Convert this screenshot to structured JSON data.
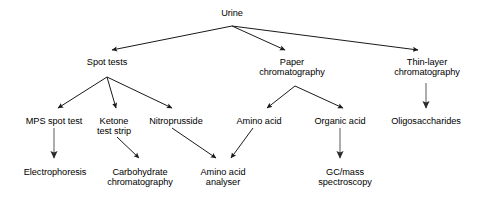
{
  "diagram": {
    "type": "flowchart",
    "background_color": "#ffffff",
    "text_color": "#000000",
    "arrow_color_dark": "#1a1a1a",
    "arrow_color_gray": "#808080",
    "nodes": [
      {
        "id": "urine",
        "label": "Urine",
        "x": 232,
        "y": 8,
        "level": 0
      },
      {
        "id": "spot-tests",
        "label": "Spot tests",
        "x": 107,
        "y": 57,
        "level": 1
      },
      {
        "id": "paper-chrom",
        "label": "Paper\nchromatography",
        "x": 292,
        "y": 57,
        "level": 1
      },
      {
        "id": "thin-layer",
        "label": "Thin-layer\nchromatography",
        "x": 427,
        "y": 57,
        "level": 1
      },
      {
        "id": "mps-spot-test",
        "label": "MPS spot test",
        "x": 54,
        "y": 116,
        "level": 2
      },
      {
        "id": "ketone-strip",
        "label": "Ketone\ntest strip",
        "x": 114,
        "y": 116,
        "level": 2
      },
      {
        "id": "nitroprusside",
        "label": "Nitroprusside",
        "x": 176,
        "y": 116,
        "level": 2
      },
      {
        "id": "amino-acid",
        "label": "Amino acid",
        "x": 259,
        "y": 116,
        "level": 2
      },
      {
        "id": "organic-acid",
        "label": "Organic acid",
        "x": 340,
        "y": 116,
        "level": 2
      },
      {
        "id": "oligosaccharides",
        "label": "Oligosaccharides",
        "x": 426,
        "y": 116,
        "level": 2
      },
      {
        "id": "electrophoresis",
        "label": "Electrophoresis",
        "x": 55,
        "y": 167,
        "level": 3
      },
      {
        "id": "carbohydrate",
        "label": "Carbohydrate\nchromatography",
        "x": 140,
        "y": 167,
        "level": 3
      },
      {
        "id": "aa-analyser",
        "label": "Amino acid\nanalyser",
        "x": 223,
        "y": 167,
        "level": 3
      },
      {
        "id": "gc-mass",
        "label": "GC/mass\nspectroscopy",
        "x": 345,
        "y": 167,
        "level": 3
      }
    ],
    "edges": [
      {
        "id": "urine-to-spot-tests",
        "from": "urine",
        "to": "spot-tests",
        "x1": 232,
        "y1": 26,
        "x2": 112,
        "y2": 50,
        "style": "dark"
      },
      {
        "id": "urine-to-paper-chrom",
        "from": "urine",
        "to": "paper-chrom",
        "x1": 232,
        "y1": 26,
        "x2": 285,
        "y2": 50,
        "style": "dark"
      },
      {
        "id": "urine-to-thin-layer",
        "from": "urine",
        "to": "thin-layer",
        "x1": 232,
        "y1": 26,
        "x2": 418,
        "y2": 50,
        "style": "dark"
      },
      {
        "id": "spot-tests-to-mps",
        "from": "spot-tests",
        "to": "mps-spot-test",
        "x1": 107,
        "y1": 77,
        "x2": 58,
        "y2": 108,
        "style": "dark"
      },
      {
        "id": "spot-tests-to-ketone",
        "from": "spot-tests",
        "to": "ketone-strip",
        "x1": 107,
        "y1": 77,
        "x2": 116,
        "y2": 108,
        "style": "dark"
      },
      {
        "id": "spot-tests-to-nitroprusside",
        "from": "spot-tests",
        "to": "nitroprusside",
        "x1": 107,
        "y1": 77,
        "x2": 172,
        "y2": 108,
        "style": "dark"
      },
      {
        "id": "paper-chrom-to-amino-acid",
        "from": "paper-chrom",
        "to": "amino-acid",
        "x1": 295,
        "y1": 86,
        "x2": 267,
        "y2": 108,
        "style": "dark"
      },
      {
        "id": "paper-chrom-to-organic-acid",
        "from": "paper-chrom",
        "to": "organic-acid",
        "x1": 295,
        "y1": 86,
        "x2": 343,
        "y2": 108,
        "style": "dark"
      },
      {
        "id": "thin-layer-to-oligo",
        "from": "thin-layer",
        "to": "oligosaccharides",
        "x1": 426,
        "y1": 83,
        "x2": 426,
        "y2": 108,
        "style": "gray"
      },
      {
        "id": "mps-to-electrophoresis",
        "from": "mps-spot-test",
        "to": "electrophoresis",
        "x1": 54,
        "y1": 128,
        "x2": 54,
        "y2": 158,
        "style": "gray"
      },
      {
        "id": "ketone-to-carbohydrate",
        "from": "ketone-strip",
        "to": "carbohydrate",
        "x1": 117,
        "y1": 137,
        "x2": 139,
        "y2": 158,
        "style": "dark"
      },
      {
        "id": "nitroprusside-to-aa-analyser",
        "from": "nitroprusside",
        "to": "aa-analyser",
        "x1": 172,
        "y1": 128,
        "x2": 216,
        "y2": 158,
        "style": "dark"
      },
      {
        "id": "amino-acid-to-aa-analyser",
        "from": "amino-acid",
        "to": "aa-analyser",
        "x1": 253,
        "y1": 128,
        "x2": 231,
        "y2": 158,
        "style": "dark"
      },
      {
        "id": "organic-acid-to-gc-mass",
        "from": "organic-acid",
        "to": "gc-mass",
        "x1": 340,
        "y1": 128,
        "x2": 340,
        "y2": 158,
        "style": "gray"
      }
    ]
  }
}
